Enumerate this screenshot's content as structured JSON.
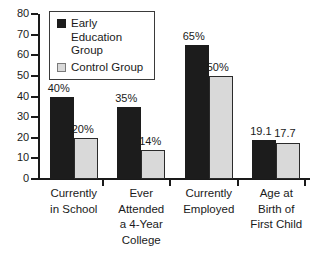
{
  "chart_data": {
    "type": "bar",
    "title": "",
    "xlabel": "",
    "ylabel": "",
    "ylim": [
      0,
      80
    ],
    "ytick_values": [
      0,
      10,
      20,
      30,
      40,
      50,
      60,
      70,
      80
    ],
    "ytick_labels": [
      "0",
      "10",
      "20",
      "30",
      "40",
      "50",
      "60",
      "70",
      "80"
    ],
    "grid": false,
    "legend_position": "top-left-inside",
    "categories": [
      "Currently in School",
      "Ever Attended a 4-Year College",
      "Currently Employed",
      "Age at Birth of First Child"
    ],
    "category_lines": [
      [
        "Currently",
        "in School"
      ],
      [
        "Ever",
        "Attended",
        "a 4-Year",
        "College"
      ],
      [
        "Currently",
        "Employed"
      ],
      [
        "Age at",
        "Birth of",
        "First Child"
      ]
    ],
    "series": [
      {
        "name": "Early Education Group",
        "color": "#1c1c1c",
        "values": [
          40,
          35,
          65,
          19.1
        ],
        "data_labels": [
          "40%",
          "35%",
          "65%",
          "19.1"
        ]
      },
      {
        "name": "Control Group",
        "color": "#d9d9d9",
        "values": [
          20,
          14,
          50,
          17.7
        ],
        "data_labels": [
          "20%",
          "14%",
          "50%",
          "17.7"
        ]
      }
    ]
  },
  "legend": {
    "items": [
      {
        "label": "Early Education Group",
        "swatch": "dark-square-icon"
      },
      {
        "label": "Control Group",
        "swatch": "light-square-icon"
      }
    ]
  }
}
